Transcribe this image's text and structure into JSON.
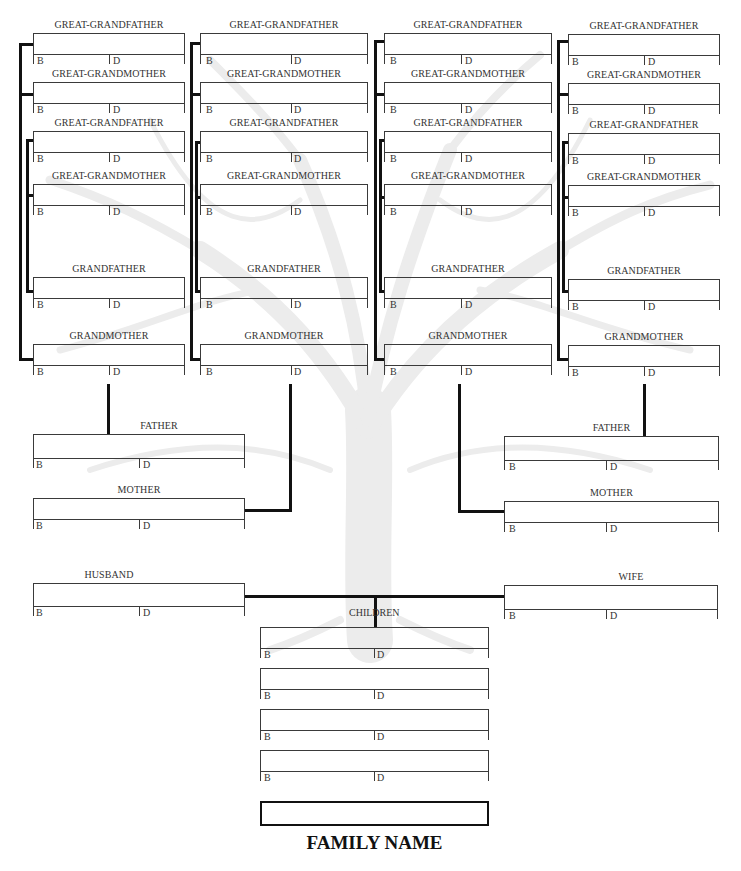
{
  "document": {
    "type": "family tree chart",
    "family_name_label": "FAMILY NAME"
  },
  "field_labels": {
    "born": "B",
    "died": "D"
  },
  "great_grandparents": {
    "col1": [
      "GREAT-GRANDFATHER",
      "GREAT-GRANDMOTHER",
      "GREAT-GRANDFATHER",
      "GREAT-GRANDMOTHER"
    ],
    "col2": [
      "GREAT-GRANDFATHER",
      "GREAT-GRANDMOTHER",
      "GREAT-GRANDFATHER",
      "GREAT-GRANDMOTHER"
    ],
    "col3": [
      "GREAT-GRANDFATHER",
      "GREAT-GRANDMOTHER",
      "GREAT-GRANDFATHER",
      "GREAT-GRANDMOTHER"
    ],
    "col4": [
      "GREAT-GRANDFATHER",
      "GREAT-GRANDMOTHER",
      "GREAT-GRANDFATHER",
      "GREAT-GRANDMOTHER"
    ]
  },
  "grandparents": {
    "col1": [
      "GRANDFATHER",
      "GRANDMOTHER"
    ],
    "col2": [
      "GRANDFATHER",
      "GRANDMOTHER"
    ],
    "col3": [
      "GRANDFATHER",
      "GRANDMOTHER"
    ],
    "col4": [
      "GRANDFATHER",
      "GRANDMOTHER"
    ]
  },
  "parents": {
    "left": [
      "FATHER",
      "MOTHER"
    ],
    "right": [
      "FATHER",
      "MOTHER"
    ]
  },
  "couple": {
    "husband": "HUSBAND",
    "wife": "WIFE"
  },
  "children": {
    "label": "CHILDREN",
    "count": 4
  },
  "colors": {
    "line": "#111111",
    "box": "#3a3a3a",
    "text": "#333333",
    "tree": "#ebebeb"
  }
}
